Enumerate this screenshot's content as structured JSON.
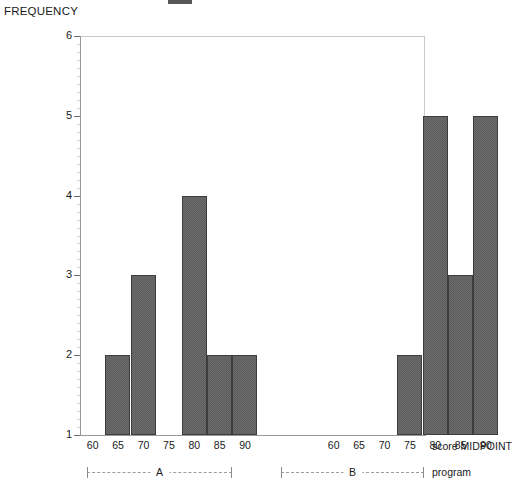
{
  "axis_title": "FREQUENCY",
  "captions": {
    "midpoint": "score MIDPOINT",
    "program": "program"
  },
  "y_ticks": [
    "6",
    "5",
    "4",
    "3",
    "2",
    "1"
  ],
  "panels": [
    {
      "label": "A",
      "tick_labels": [
        "60",
        "65",
        "70",
        "75",
        "80",
        "85",
        "90"
      ]
    },
    {
      "label": "B",
      "tick_labels": [
        "60",
        "65",
        "70",
        "75",
        "80",
        "85",
        "90"
      ]
    }
  ],
  "chart_data": {
    "type": "bar",
    "title": "",
    "subtitle": "",
    "xlabel": "score MIDPOINT",
    "ylabel": "FREQUENCY",
    "categories": [
      60,
      65,
      70,
      75,
      80,
      85,
      90
    ],
    "ylim": [
      1,
      6
    ],
    "y_ticks": [
      1,
      2,
      3,
      4,
      5,
      6
    ],
    "grid": false,
    "legend": "none",
    "panel_variable": "program",
    "panels": [
      {
        "name": "A",
        "categories": [
          60,
          65,
          70,
          75,
          80,
          85,
          90
        ],
        "values": [
          0,
          2,
          3,
          0,
          4,
          2,
          2
        ]
      },
      {
        "name": "B",
        "categories": [
          60,
          65,
          70,
          75,
          80,
          85,
          90
        ],
        "values": [
          0,
          0,
          0,
          2,
          5,
          3,
          5
        ]
      }
    ],
    "series": [
      {
        "name": "A",
        "values": [
          0,
          2,
          3,
          0,
          4,
          2,
          2
        ]
      },
      {
        "name": "B",
        "values": [
          0,
          0,
          0,
          2,
          5,
          3,
          5
        ]
      }
    ],
    "bar_color": "#6f6f6f",
    "bar_edge_color": "#3d3d3d",
    "axis_color": "#9a9a9a",
    "background": "#ffffff"
  }
}
